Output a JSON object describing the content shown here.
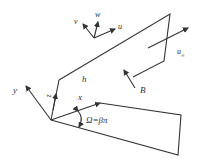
{
  "diagram": {
    "type": "geometry-schematic",
    "labels": {
      "v": "v",
      "w": "w",
      "u": "u",
      "h": "h",
      "u_inf": "u",
      "u_inf_sub": "∞",
      "B": "B",
      "y": "y",
      "z": "z",
      "x": "x",
      "angle": "Ω=βπ"
    },
    "colors": {
      "stroke": "#333333",
      "background": "#ffffff",
      "text": "#333333"
    }
  }
}
